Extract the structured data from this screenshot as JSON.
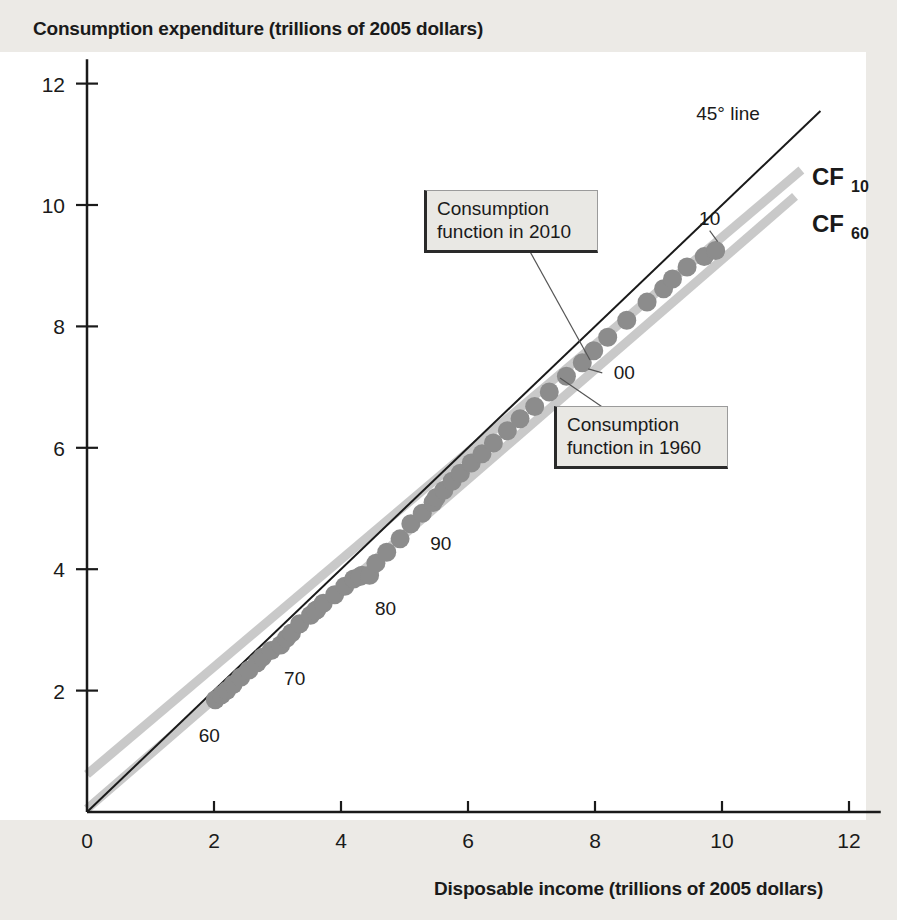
{
  "figure": {
    "y_axis_title": "Consumption expenditure (trillions of 2005 dollars)",
    "x_axis_title": "Disposable income (trillions of 2005 dollars)"
  },
  "annotations": {
    "line45_label": "45° line",
    "cf10_label": "CF",
    "cf10_sub": "10",
    "cf60_label": "CF",
    "cf60_sub": "60",
    "callout_2010_line1": "Consumption",
    "callout_2010_line2": "function in 2010",
    "callout_1960_line1": "Consumption",
    "callout_1960_line2": "function in 1960"
  },
  "colors": {
    "page_background": "#eceae6",
    "plot_background": "#ffffff",
    "axis": "#1a1a1a",
    "marker": "#8c8c8c",
    "cf_line": "#c9c9c9",
    "line45": "#1a1a1a",
    "callout_fill": "#e9e8e4",
    "callout_border": "#2a2a2a"
  },
  "chart_data": {
    "type": "scatter",
    "title": "",
    "xlabel": "Disposable income (trillions of 2005 dollars)",
    "ylabel": "Consumption expenditure (trillions of 2005 dollars)",
    "xlim": [
      0,
      12
    ],
    "ylim": [
      0,
      12
    ],
    "xticks": [
      0,
      2,
      4,
      6,
      8,
      10,
      12
    ],
    "yticks": [
      0,
      2,
      4,
      6,
      8,
      10,
      12
    ],
    "grid": false,
    "legend": "inline-labels",
    "point_labels": [
      {
        "label": "60",
        "x": 2.02,
        "y": 1.85
      },
      {
        "label": "70",
        "x": 3.05,
        "y": 2.75
      },
      {
        "label": "80",
        "x": 4.45,
        "y": 3.9
      },
      {
        "label": "90",
        "x": 5.1,
        "y": 4.75
      },
      {
        "label": "00",
        "x": 7.8,
        "y": 7.4
      },
      {
        "label": "10",
        "x": 9.9,
        "y": 9.25
      }
    ],
    "series": [
      {
        "name": "Annual observations 1960-2010",
        "marker": "circle",
        "color": "#8c8c8c",
        "x": [
          2.02,
          2.12,
          2.2,
          2.3,
          2.42,
          2.55,
          2.68,
          2.76,
          2.9,
          3.05,
          3.14,
          3.22,
          3.35,
          3.52,
          3.62,
          3.6,
          3.72,
          3.9,
          4.06,
          4.2,
          4.33,
          4.3,
          4.45,
          4.55,
          4.72,
          4.93,
          5.1,
          5.28,
          5.45,
          5.5,
          5.62,
          5.75,
          5.88,
          6.05,
          6.22,
          6.4,
          6.62,
          6.82,
          7.05,
          7.28,
          7.55,
          7.8,
          7.98,
          8.2,
          8.5,
          8.82,
          9.08,
          9.22,
          9.45,
          9.72,
          9.9
        ],
        "y": [
          1.85,
          1.93,
          2.0,
          2.1,
          2.22,
          2.34,
          2.46,
          2.55,
          2.66,
          2.75,
          2.86,
          2.95,
          3.1,
          3.24,
          3.33,
          3.32,
          3.44,
          3.58,
          3.72,
          3.84,
          3.9,
          3.88,
          3.9,
          4.1,
          4.28,
          4.5,
          4.75,
          4.92,
          5.1,
          5.18,
          5.3,
          5.45,
          5.58,
          5.75,
          5.9,
          6.08,
          6.28,
          6.48,
          6.68,
          6.92,
          7.18,
          7.4,
          7.6,
          7.82,
          8.1,
          8.4,
          8.62,
          8.78,
          8.98,
          9.15,
          9.25
        ]
      }
    ],
    "reference_lines": [
      {
        "name": "45° line",
        "type": "line",
        "intercept": 0.0,
        "slope": 1.0,
        "x_range": [
          0,
          11.55
        ],
        "color": "#1a1a1a",
        "width": 2
      },
      {
        "name": "CF10",
        "type": "line",
        "intercept": 0.62,
        "slope": 0.885,
        "x_range": [
          0,
          11.25
        ],
        "color": "#c9c9c9",
        "width": 9
      },
      {
        "name": "CF60",
        "type": "line",
        "intercept": 0.05,
        "slope": 0.905,
        "x_range": [
          0,
          11.15
        ],
        "color": "#c9c9c9",
        "width": 9
      }
    ]
  }
}
